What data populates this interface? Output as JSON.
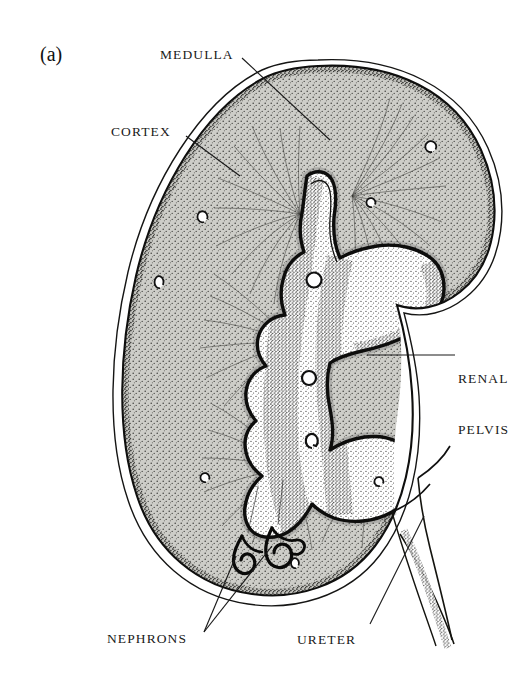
{
  "figure": {
    "panel_letter": "(a)",
    "style": "black-and-white-stipple-line-drawing",
    "background_color": "#ffffff",
    "ink_color": "#1a1a1a",
    "cortex_fill": "#c9c9c4",
    "medulla_fill": "#b4b4ae",
    "pelvis_fill": "#ffffff"
  },
  "labels": {
    "medulla": "MEDULLA",
    "cortex": "CORTEX",
    "renal_pelvis_line1": "RENAL",
    "renal_pelvis_line2": "PELVIS",
    "nephrons": "NEPHRONS",
    "ureter": "URETER"
  },
  "leader_lines": [
    {
      "name": "medulla-leader",
      "from": [
        242,
        58
      ],
      "to": [
        330,
        140
      ]
    },
    {
      "name": "cortex-leader",
      "from": [
        186,
        136
      ],
      "to": [
        240,
        175
      ]
    },
    {
      "name": "renal-pelvis-leader",
      "from": [
        455,
        355
      ],
      "to": [
        367,
        355
      ]
    },
    {
      "name": "nephrons-leader-a",
      "from": [
        204,
        632
      ],
      "to": [
        236,
        556
      ]
    },
    {
      "name": "nephrons-leader-b",
      "from": [
        204,
        632
      ],
      "to": [
        270,
        548
      ]
    },
    {
      "name": "ureter-leader",
      "from": [
        370,
        624
      ],
      "to": [
        424,
        516
      ]
    }
  ]
}
